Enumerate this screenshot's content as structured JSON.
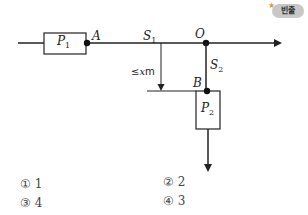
{
  "badge": {
    "label": "빈출",
    "star": "★"
  },
  "diagram": {
    "boxes": [
      {
        "id": "P1",
        "label": "P",
        "sub": "1"
      },
      {
        "id": "P2",
        "label": "P",
        "sub": "2"
      }
    ],
    "points": [
      {
        "id": "A",
        "label": "A"
      },
      {
        "id": "O",
        "label": "O"
      },
      {
        "id": "B",
        "label": "B"
      }
    ],
    "segments": [
      {
        "id": "S1",
        "label": "S",
        "sub": "1"
      },
      {
        "id": "S2",
        "label": "S",
        "sub": "2"
      }
    ],
    "dimension": {
      "prefix": "≤",
      "var": "x",
      "unit": "m"
    }
  },
  "choices": [
    {
      "mark": "①",
      "value": "1"
    },
    {
      "mark": "②",
      "value": "2"
    },
    {
      "mark": "③",
      "value": "4"
    },
    {
      "mark": "④",
      "value": "3"
    }
  ]
}
